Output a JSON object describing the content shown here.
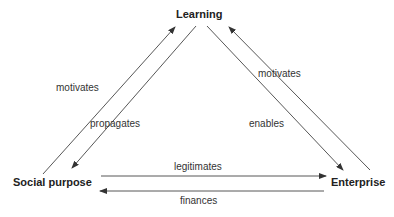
{
  "nodes": {
    "learning": "Learning",
    "social_purpose": "Social purpose",
    "enterprise": "Enterprise"
  },
  "edges": [
    {
      "from": "Social purpose",
      "to": "Learning",
      "label": "motivates"
    },
    {
      "from": "Learning",
      "to": "Social purpose",
      "label": "propagates"
    },
    {
      "from": "Learning",
      "to": "Enterprise",
      "label": "enables"
    },
    {
      "from": "Enterprise",
      "to": "Learning",
      "label": "motivates"
    },
    {
      "from": "Social purpose",
      "to": "Enterprise",
      "label": "legitimates"
    },
    {
      "from": "Enterprise",
      "to": "Social purpose",
      "label": "finances"
    }
  ],
  "colors": {
    "line": "#333333",
    "text": "#222222"
  }
}
